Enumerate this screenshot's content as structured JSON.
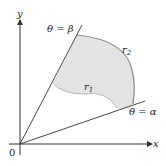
{
  "diagram": {
    "axes": {
      "x_label": "x",
      "y_label": "y",
      "origin_label": "0"
    },
    "rays": [
      {
        "name": "theta-beta",
        "label": "θ = β"
      },
      {
        "name": "theta-alpha",
        "label": "θ = α"
      }
    ],
    "curves": [
      {
        "name": "r1",
        "label": "r",
        "sub": "1"
      },
      {
        "name": "r2",
        "label": "r",
        "sub": "2"
      }
    ],
    "colors": {
      "region_fill": "#e3e3e3",
      "region_stroke": "#8a8a8a",
      "line": "#333333"
    }
  }
}
